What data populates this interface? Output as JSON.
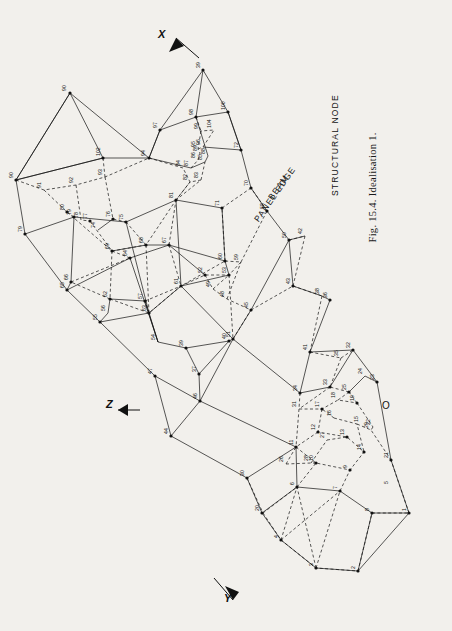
{
  "figure": {
    "caption": "Fig. 15.4. Idealisation 1.",
    "legend": [
      {
        "id": "beam",
        "label": "BEAM"
      },
      {
        "id": "panel-edge",
        "label": "PANEL EDGE"
      },
      {
        "id": "structural-node",
        "label": "STRUCTURAL NODE"
      }
    ],
    "axes": [
      {
        "id": "x",
        "label": "X"
      },
      {
        "id": "y",
        "label": "Y"
      },
      {
        "id": "z",
        "label": "Z"
      },
      {
        "id": "origin",
        "label": "O"
      }
    ],
    "node_numbers": [
      "1",
      "2",
      "3",
      "4",
      "5",
      "6",
      "7",
      "8",
      "9",
      "10",
      "11",
      "12",
      "13",
      "14",
      "15",
      "16",
      "17",
      "18",
      "19",
      "20",
      "21",
      "22",
      "23",
      "24",
      "25",
      "26",
      "27",
      "28",
      "29",
      "30",
      "31",
      "32",
      "33",
      "34",
      "35",
      "36",
      "37",
      "38",
      "39",
      "40",
      "41",
      "42",
      "43",
      "44",
      "45",
      "46",
      "47",
      "48",
      "49",
      "50",
      "51",
      "52",
      "53",
      "54",
      "55",
      "56",
      "57",
      "58",
      "59",
      "60",
      "61",
      "62",
      "63",
      "64",
      "65",
      "66",
      "67",
      "68",
      "69",
      "70",
      "71",
      "72",
      "73",
      "74",
      "75",
      "76",
      "77",
      "78",
      "79",
      "80",
      "81",
      "82",
      "83",
      "84",
      "85",
      "86",
      "87",
      "88",
      "89",
      "90",
      "91",
      "92",
      "93",
      "94",
      "95",
      "96",
      "97",
      "98",
      "99",
      "100",
      "101",
      "102",
      "103",
      "104"
    ]
  },
  "diagram_geometry": {
    "description": "Wire-frame perspective idealisation of a structure: solid lines are beams/panel edges, dashed lines are hidden/secondary members, filled dots are structural nodes.",
    "nodes": [
      {
        "n": "1",
        "x": 409,
        "y": 513
      },
      {
        "n": "2",
        "x": 358,
        "y": 571
      },
      {
        "n": "3",
        "x": 316,
        "y": 568
      },
      {
        "n": "4",
        "x": 281,
        "y": 540
      },
      {
        "n": "5",
        "x": 262,
        "y": 513
      },
      {
        "n": "6",
        "x": 297,
        "y": 487
      },
      {
        "n": "7",
        "x": 340,
        "y": 491
      },
      {
        "n": "8",
        "x": 372,
        "y": 513
      },
      {
        "n": "9",
        "x": 350,
        "y": 470
      },
      {
        "n": "10",
        "x": 316,
        "y": 463
      },
      {
        "n": "11",
        "x": 296,
        "y": 447
      },
      {
        "n": "12",
        "x": 318,
        "y": 432
      },
      {
        "n": "13",
        "x": 347,
        "y": 437
      },
      {
        "n": "14",
        "x": 364,
        "y": 452
      },
      {
        "n": "15",
        "x": 357,
        "y": 424
      },
      {
        "n": "16",
        "x": 334,
        "y": 418
      },
      {
        "n": "17",
        "x": 322,
        "y": 409
      },
      {
        "n": "18",
        "x": 338,
        "y": 400
      },
      {
        "n": "19",
        "x": 357,
        "y": 403
      },
      {
        "n": "20",
        "x": 263,
        "y": 513
      },
      {
        "n": "21",
        "x": 391,
        "y": 460
      },
      {
        "n": "22",
        "x": 373,
        "y": 427
      },
      {
        "n": "23",
        "x": 377,
        "y": 382
      },
      {
        "n": "24",
        "x": 365,
        "y": 376
      },
      {
        "n": "25",
        "x": 349,
        "y": 392
      },
      {
        "n": "26",
        "x": 286,
        "y": 464
      },
      {
        "n": "27",
        "x": 327,
        "y": 440
      },
      {
        "n": "28",
        "x": 311,
        "y": 463
      },
      {
        "n": "29",
        "x": 371,
        "y": 430
      },
      {
        "n": "30",
        "x": 247,
        "y": 478
      },
      {
        "n": "31",
        "x": 299,
        "y": 409
      },
      {
        "n": "32",
        "x": 353,
        "y": 350
      },
      {
        "n": "33",
        "x": 330,
        "y": 387
      },
      {
        "n": "34",
        "x": 300,
        "y": 393
      },
      {
        "n": "35",
        "x": 341,
        "y": 358
      },
      {
        "n": "36",
        "x": 330,
        "y": 300
      },
      {
        "n": "37",
        "x": 199,
        "y": 374
      },
      {
        "n": "38",
        "x": 322,
        "y": 296
      },
      {
        "n": "39",
        "x": 186,
        "y": 348
      },
      {
        "n": "40",
        "x": 229,
        "y": 341
      },
      {
        "n": "41",
        "x": 310,
        "y": 352
      },
      {
        "n": "42",
        "x": 305,
        "y": 236
      },
      {
        "n": "43",
        "x": 293,
        "y": 286
      },
      {
        "n": "44",
        "x": 171,
        "y": 436
      },
      {
        "n": "45",
        "x": 251,
        "y": 310
      },
      {
        "n": "46",
        "x": 200,
        "y": 401
      },
      {
        "n": "47",
        "x": 155,
        "y": 376
      },
      {
        "n": "48",
        "x": 227,
        "y": 299
      },
      {
        "n": "49",
        "x": 213,
        "y": 289
      },
      {
        "n": "50",
        "x": 289,
        "y": 240
      },
      {
        "n": "51",
        "x": 233,
        "y": 339
      },
      {
        "n": "52",
        "x": 205,
        "y": 275
      },
      {
        "n": "53",
        "x": 229,
        "y": 275
      },
      {
        "n": "54",
        "x": 158,
        "y": 342
      },
      {
        "n": "55",
        "x": 100,
        "y": 322
      },
      {
        "n": "56",
        "x": 108,
        "y": 313
      },
      {
        "n": "57",
        "x": 145,
        "y": 301
      },
      {
        "n": "58",
        "x": 267,
        "y": 211
      },
      {
        "n": "59",
        "x": 241,
        "y": 262
      },
      {
        "n": "60",
        "x": 225,
        "y": 261
      },
      {
        "n": "61",
        "x": 181,
        "y": 286
      },
      {
        "n": "62",
        "x": 110,
        "y": 299
      },
      {
        "n": "63",
        "x": 149,
        "y": 313
      },
      {
        "n": "64",
        "x": 130,
        "y": 258
      },
      {
        "n": "65",
        "x": 67,
        "y": 290
      },
      {
        "n": "66",
        "x": 71,
        "y": 282
      },
      {
        "n": "67",
        "x": 169,
        "y": 245
      },
      {
        "n": "68",
        "x": 146,
        "y": 245
      },
      {
        "n": "69",
        "x": 112,
        "y": 251
      },
      {
        "n": "70",
        "x": 251,
        "y": 188
      },
      {
        "n": "71",
        "x": 222,
        "y": 208
      },
      {
        "n": "72",
        "x": 241,
        "y": 150
      },
      {
        "n": "73",
        "x": 25,
        "y": 234
      },
      {
        "n": "74",
        "x": 98,
        "y": 230
      },
      {
        "n": "75",
        "x": 126,
        "y": 222
      },
      {
        "n": "76",
        "x": 113,
        "y": 219
      },
      {
        "n": "77",
        "x": 90,
        "y": 221
      },
      {
        "n": "78",
        "x": 81,
        "y": 220
      },
      {
        "n": "79",
        "x": 74,
        "y": 217
      },
      {
        "n": "80",
        "x": 67,
        "y": 212
      },
      {
        "n": "81",
        "x": 176,
        "y": 200
      },
      {
        "n": "82",
        "x": 190,
        "y": 182
      },
      {
        "n": "83",
        "x": 201,
        "y": 180
      },
      {
        "n": "84",
        "x": 183,
        "y": 168
      },
      {
        "n": "85",
        "x": 205,
        "y": 162
      },
      {
        "n": "86",
        "x": 198,
        "y": 160
      },
      {
        "n": "87",
        "x": 191,
        "y": 168
      },
      {
        "n": "88",
        "x": 208,
        "y": 156
      },
      {
        "n": "89",
        "x": 200,
        "y": 153
      },
      {
        "n": "90",
        "x": 16,
        "y": 180
      },
      {
        "n": "91",
        "x": 44,
        "y": 190
      },
      {
        "n": "92",
        "x": 76,
        "y": 185
      },
      {
        "n": "93",
        "x": 105,
        "y": 177
      },
      {
        "n": "94",
        "x": 149,
        "y": 158
      },
      {
        "n": "95",
        "x": 198,
        "y": 149
      },
      {
        "n": "96",
        "x": 203,
        "y": 147
      },
      {
        "n": "97",
        "x": 160,
        "y": 130
      },
      {
        "n": "98",
        "x": 196,
        "y": 117
      },
      {
        "n": "99",
        "x": 201,
        "y": 131
      },
      {
        "n": "100",
        "x": 228,
        "y": 112
      },
      {
        "n": "101",
        "x": 203,
        "y": 70
      },
      {
        "n": "102",
        "x": 103,
        "y": 158
      },
      {
        "n": "103",
        "x": 70,
        "y": 93
      },
      {
        "n": "104",
        "x": 214,
        "y": 130
      }
    ]
  }
}
